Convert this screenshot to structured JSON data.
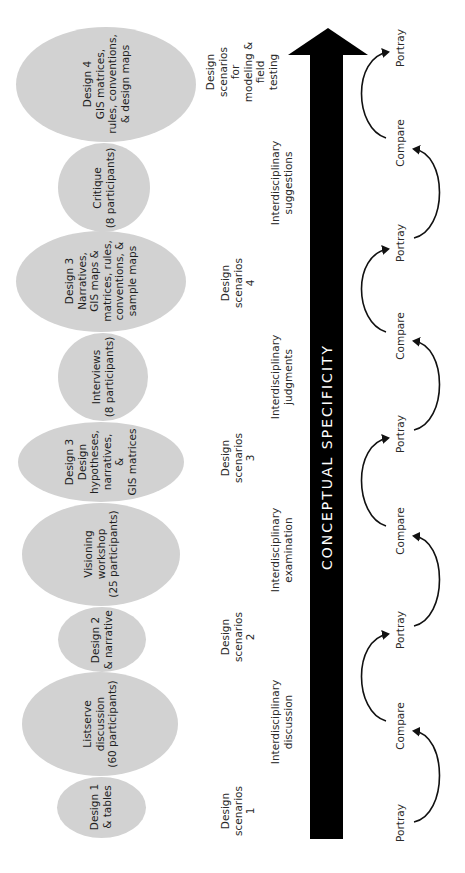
{
  "diagram": {
    "orientation": "rotated-90-ccw",
    "colors": {
      "ellipse_fill": "#d2d2d2",
      "arrow": "#000000",
      "text": "#2a2a2a",
      "background": "#ffffff"
    },
    "activities": [
      {
        "id": "design4",
        "lines": [
          "Design 4",
          "GIS matrices,",
          "rules, conventions,",
          "& design maps"
        ]
      },
      {
        "id": "critique",
        "lines": [
          "Critique",
          "(8 participants)"
        ]
      },
      {
        "id": "design3b",
        "lines": [
          "Design 3",
          "Narratives,",
          "GIS maps &",
          "matrices, rules,",
          "conventions, &",
          "sample maps"
        ]
      },
      {
        "id": "interviews",
        "lines": [
          "Interviews",
          "(8 participants)"
        ]
      },
      {
        "id": "design3a",
        "lines": [
          "Design 3",
          "Design",
          "hypotheses,",
          "narratives,",
          "&",
          "GIS matrices"
        ]
      },
      {
        "id": "visioning",
        "lines": [
          "Visioning",
          "workshop",
          "(25 participants)"
        ]
      },
      {
        "id": "design2",
        "lines": [
          "Design 2",
          "& narrative"
        ]
      },
      {
        "id": "listserve",
        "lines": [
          "Listserve",
          "discussion",
          "(60 participants)"
        ]
      },
      {
        "id": "design1",
        "lines": [
          "Design 1",
          "& tables"
        ]
      }
    ],
    "stages": [
      {
        "id": "final",
        "lines": [
          "Design",
          "scenarios",
          "for",
          "modeling &",
          "field",
          "testing"
        ]
      },
      {
        "id": "sugg",
        "lines": [
          "Interdisciplinary",
          "suggestions"
        ]
      },
      {
        "id": "ds4",
        "lines": [
          "Design",
          "scenarios",
          "4"
        ]
      },
      {
        "id": "judg",
        "lines": [
          "Interdisciplinary",
          "judgments"
        ]
      },
      {
        "id": "ds3",
        "lines": [
          "Design",
          "scenarios",
          "3"
        ]
      },
      {
        "id": "exam",
        "lines": [
          "Interdisciplinary",
          "examination"
        ]
      },
      {
        "id": "ds2",
        "lines": [
          "Design",
          "scenarios",
          "2"
        ]
      },
      {
        "id": "disc",
        "lines": [
          "Interdisciplinary",
          "discussion"
        ]
      },
      {
        "id": "ds1",
        "lines": [
          "Design",
          "scenarios",
          "1"
        ]
      }
    ],
    "axis_label": "CONCEPTUAL SPECIFICITY",
    "cycle": [
      "Portray",
      "Compare",
      "Portray",
      "Compare",
      "Portray",
      "Compare",
      "Portray",
      "Compare",
      "Portray"
    ]
  }
}
